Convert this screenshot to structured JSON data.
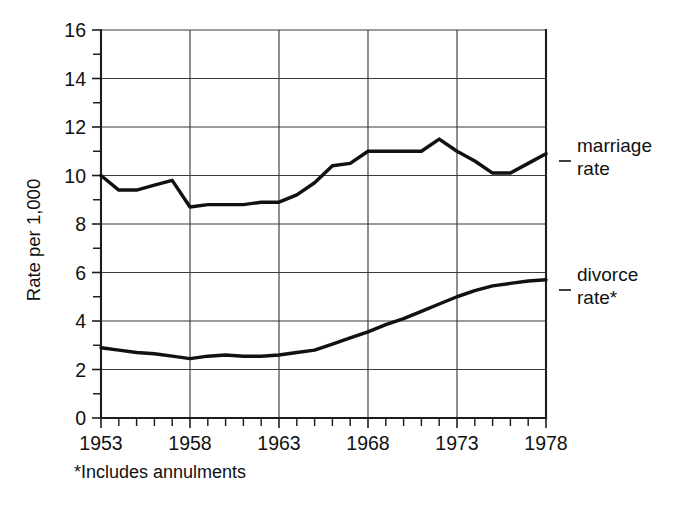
{
  "chart_data": {
    "type": "line",
    "title": "",
    "xlabel": "",
    "ylabel": "Rate per 1,000",
    "footnote": "*Includes annulments",
    "xlim": [
      1953,
      1978
    ],
    "ylim": [
      0,
      16
    ],
    "grid": true,
    "legend_position": "right-of-plot",
    "y_major_ticks": [
      0,
      2,
      4,
      6,
      8,
      10,
      12,
      14,
      16
    ],
    "y_minor_ticks": [
      1,
      3,
      5,
      7,
      9,
      11,
      13,
      15
    ],
    "y_tick_labels": [
      "0",
      "2",
      "4",
      "6",
      "8",
      "10",
      "12",
      "14",
      "16"
    ],
    "x_tick_labels": [
      "1953",
      "1958",
      "1963",
      "1968",
      "1973",
      "1978"
    ],
    "x_labeled_values": [
      1953,
      1958,
      1963,
      1968,
      1973,
      1978
    ],
    "x_gridline_values": [
      1958,
      1963,
      1968,
      1973
    ],
    "x_all_ticks": [
      1953,
      1954,
      1955,
      1956,
      1957,
      1958,
      1959,
      1960,
      1961,
      1962,
      1963,
      1964,
      1965,
      1966,
      1967,
      1968,
      1969,
      1970,
      1971,
      1972,
      1973,
      1974,
      1975,
      1976,
      1977,
      1978
    ],
    "x": [
      1953,
      1954,
      1955,
      1956,
      1957,
      1958,
      1959,
      1960,
      1961,
      1962,
      1963,
      1964,
      1965,
      1966,
      1967,
      1968,
      1969,
      1970,
      1971,
      1972,
      1973,
      1974,
      1975,
      1976,
      1977,
      1978
    ],
    "series": [
      {
        "name": "marriage rate",
        "label": "marriage\nrate",
        "color": "#111111",
        "values": [
          10.0,
          9.4,
          9.4,
          9.6,
          9.8,
          8.7,
          8.8,
          8.8,
          8.8,
          8.9,
          8.9,
          9.2,
          9.7,
          10.4,
          10.5,
          11.0,
          11.0,
          11.0,
          11.0,
          11.5,
          11.0,
          10.6,
          10.1,
          10.1,
          10.5,
          10.9
        ]
      },
      {
        "name": "divorce rate",
        "label": "divorce\nrate*",
        "color": "#111111",
        "values": [
          2.9,
          2.8,
          2.7,
          2.65,
          2.55,
          2.45,
          2.55,
          2.6,
          2.55,
          2.55,
          2.6,
          2.7,
          2.8,
          3.05,
          3.3,
          3.55,
          3.85,
          4.1,
          4.4,
          4.7,
          5.0,
          5.25,
          5.45,
          5.55,
          5.65,
          5.7
        ]
      }
    ]
  },
  "legend": {
    "marriage_line1": "marriage",
    "marriage_line2": "rate",
    "divorce_line1": "divorce",
    "divorce_line2": "rate*"
  },
  "axis": {
    "y_title": "Rate per 1,000"
  },
  "footnote": {
    "text": "*Includes annulments"
  }
}
